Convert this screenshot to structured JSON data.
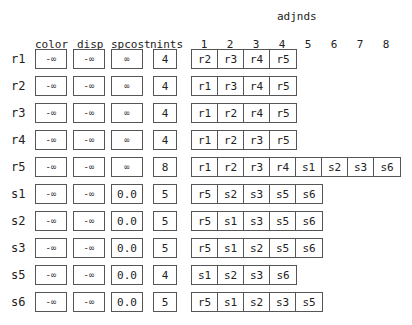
{
  "headers": {
    "adjnds": "adjnds",
    "color": "color",
    "disp": "disp",
    "spcost": "spcost",
    "nints": "nints",
    "adj_columns": [
      "1",
      "2",
      "3",
      "4",
      "5",
      "6",
      "7",
      "8"
    ]
  },
  "rows": [
    {
      "label": "r1",
      "color": "-∞",
      "disp": "-∞",
      "spcost": "∞",
      "nints": "4",
      "adjnds": [
        "r2",
        "r3",
        "r4",
        "r5"
      ]
    },
    {
      "label": "r2",
      "color": "-∞",
      "disp": "-∞",
      "spcost": "∞",
      "nints": "4",
      "adjnds": [
        "r1",
        "r3",
        "r4",
        "r5"
      ]
    },
    {
      "label": "r3",
      "color": "-∞",
      "disp": "-∞",
      "spcost": "∞",
      "nints": "4",
      "adjnds": [
        "r1",
        "r2",
        "r4",
        "r5"
      ]
    },
    {
      "label": "r4",
      "color": "-∞",
      "disp": "-∞",
      "spcost": "∞",
      "nints": "4",
      "adjnds": [
        "r1",
        "r2",
        "r3",
        "r5"
      ]
    },
    {
      "label": "r5",
      "color": "-∞",
      "disp": "-∞",
      "spcost": "∞",
      "nints": "8",
      "adjnds": [
        "r1",
        "r2",
        "r3",
        "r4",
        "s1",
        "s2",
        "s3",
        "s6"
      ]
    },
    {
      "label": "s1",
      "color": "-∞",
      "disp": "-∞",
      "spcost": "0.0",
      "nints": "5",
      "adjnds": [
        "r5",
        "s2",
        "s3",
        "s5",
        "s6"
      ]
    },
    {
      "label": "s2",
      "color": "-∞",
      "disp": "-∞",
      "spcost": "0.0",
      "nints": "5",
      "adjnds": [
        "r5",
        "s1",
        "s3",
        "s5",
        "s6"
      ]
    },
    {
      "label": "s3",
      "color": "-∞",
      "disp": "-∞",
      "spcost": "0.0",
      "nints": "5",
      "adjnds": [
        "r5",
        "s1",
        "s2",
        "s5",
        "s6"
      ]
    },
    {
      "label": "s5",
      "color": "-∞",
      "disp": "-∞",
      "spcost": "0.0",
      "nints": "4",
      "adjnds": [
        "s1",
        "s2",
        "s3",
        "s6"
      ]
    },
    {
      "label": "s6",
      "color": "-∞",
      "disp": "-∞",
      "spcost": "0.0",
      "nints": "5",
      "adjnds": [
        "r5",
        "s1",
        "s2",
        "s3",
        "s5"
      ]
    }
  ]
}
